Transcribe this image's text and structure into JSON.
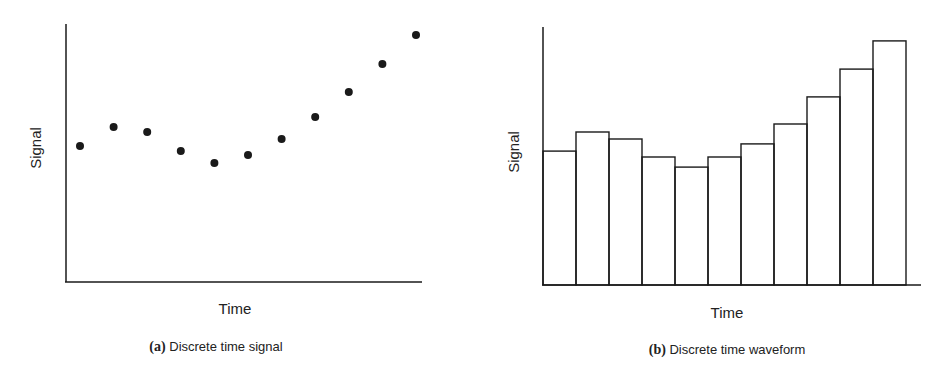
{
  "chart_data": [
    {
      "type": "scatter",
      "title": "Discrete time signal",
      "panel_label": "(a)",
      "xlabel": "Time",
      "ylabel": "Signal",
      "x": [
        1,
        2,
        3,
        4,
        5,
        6,
        7,
        8,
        9,
        10,
        11
      ],
      "values": [
        52.7,
        60.1,
        58.1,
        50.8,
        46.1,
        49.2,
        55.4,
        64.0,
        73.6,
        84.5,
        95.7
      ],
      "ylim": [
        0,
        100
      ],
      "grid": false,
      "ticks": false
    },
    {
      "type": "bar",
      "title": "Discrete time waveform",
      "panel_label": "(b)",
      "xlabel": "Time",
      "ylabel": "Signal",
      "categories": [
        1,
        2,
        3,
        4,
        5,
        6,
        7,
        8,
        9,
        10,
        11
      ],
      "values": [
        51.9,
        59.3,
        56.6,
        49.6,
        45.7,
        49.6,
        54.7,
        62.4,
        72.9,
        83.7,
        94.6
      ],
      "ylim": [
        0,
        100
      ],
      "grid": false,
      "ticks": false,
      "bar_style": "outlined, adjacent (no gaps)"
    }
  ],
  "captions": {
    "a": {
      "label": "(a)",
      "text": " Discrete time signal"
    },
    "b": {
      "label": "(b)",
      "text": " Discrete time waveform"
    }
  },
  "colors": {
    "ink": "#1a1a1a",
    "background": "#ffffff"
  }
}
